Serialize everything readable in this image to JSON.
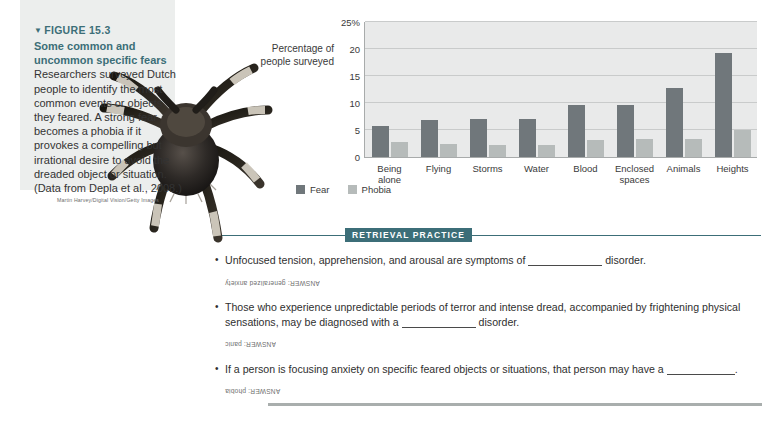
{
  "figure": {
    "marker": "▼",
    "number": "FIGURE 15.3",
    "title": "Some common and uncommon specific fears",
    "body": " Researchers surveyed Dutch people to identify the most common events or objects they feared. A strong fear becomes a phobia if it provokes a compelling but irrational desire to avoid the dreaded object or situation. (Data from Depla et al., 2008.)",
    "photo_credit": "Martin Harvey/Digital Vision/Getty Images",
    "photo_alt": "tarantula-photo",
    "header_color": "#3c6e78"
  },
  "chart_data": {
    "type": "bar",
    "title": "",
    "xlabel": "",
    "ylabel": "Percentage of people surveyed",
    "ylim": [
      0,
      25
    ],
    "yticks": [
      "0",
      "5",
      "10",
      "15",
      "20",
      "25%"
    ],
    "ytick_values": [
      0,
      5,
      10,
      15,
      20,
      25
    ],
    "grid": true,
    "legend_position": "bottom-left",
    "categories": [
      "Being alone",
      "Flying",
      "Storms",
      "Water",
      "Blood",
      "Enclosed spaces",
      "Animals",
      "Heights"
    ],
    "series": [
      {
        "name": "Fear",
        "color": "#70777b",
        "values": [
          5.8,
          6.9,
          7.0,
          7.1,
          9.6,
          9.6,
          12.7,
          19.3
        ]
      },
      {
        "name": "Phobia",
        "color": "#b6bbba",
        "values": [
          2.7,
          2.5,
          2.2,
          2.2,
          3.2,
          3.3,
          3.3,
          5.0
        ]
      }
    ]
  },
  "retrieval": {
    "title": "RETRIEVAL PRACTICE",
    "accent_color": "#3c6e78",
    "items": [
      {
        "text_before": "Unfocused tension, apprehension, and arousal are symptoms of",
        "text_after": "disorder.",
        "answer": "ANSWER: generalized anxiety"
      },
      {
        "text_before": "Those who experience unpredictable periods of terror and intense dread, accompanied by frightening physical sensations, may be diagnosed with a",
        "text_after": "disorder.",
        "answer": "ANSWER: panic"
      },
      {
        "text_before": "If a person is focusing anxiety on specific feared objects or situations, that person may have a",
        "text_after": ".",
        "answer": "ANSWER: phobia"
      }
    ]
  }
}
